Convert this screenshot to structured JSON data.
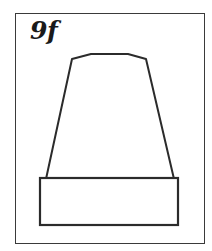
{
  "figure": {
    "label": "9f",
    "stroke_color": "#2b2b2b",
    "frame_color": "#3a3a3a",
    "shapes": [
      {
        "name": "tapered-top",
        "type": "polyline",
        "points": "46,179 72,59 91,54 128,54 146,59 174,179"
      },
      {
        "name": "base-block",
        "type": "rect",
        "x": 40,
        "y": 178,
        "width": 138,
        "height": 47
      }
    ]
  }
}
